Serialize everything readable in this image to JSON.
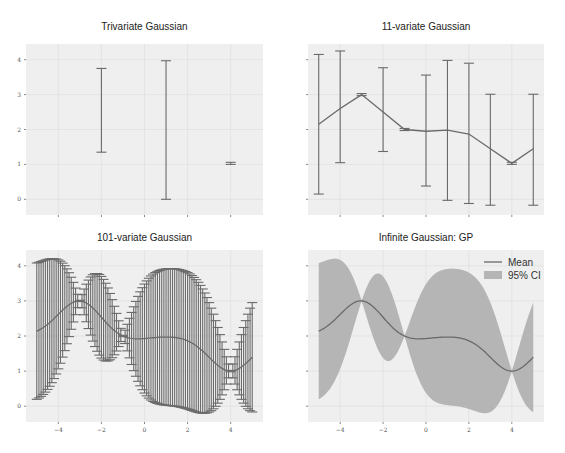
{
  "figure": {
    "width": 565,
    "height": 453,
    "background": "#ffffff"
  },
  "colors": {
    "axes_bg": "#eaeaf2",
    "axes_bg_light": "#efefef",
    "grid": "#dcdcdc",
    "line": "#6a6a6a",
    "fill": "#b5b5b5",
    "text": "#222222"
  },
  "chart_data": [
    {
      "type": "errorbar",
      "title": "Trivariate Gaussian",
      "panel": "top-left",
      "xlim": [
        -5.5,
        5.5
      ],
      "ylim": [
        -0.45,
        4.45
      ],
      "xticks": [
        -4,
        -2,
        0,
        2,
        4
      ],
      "xtick_labels": [
        "",
        "",
        "",
        "",
        ""
      ],
      "yticks": [
        0,
        1,
        2,
        3,
        4
      ],
      "ytick_labels": [
        "0",
        "1",
        "2",
        "3",
        "4"
      ],
      "connect_means": false,
      "points": [
        {
          "x": -2,
          "mean": 2.55,
          "lo": 1.35,
          "hi": 3.75
        },
        {
          "x": 1,
          "mean": 2.0,
          "lo": 0.0,
          "hi": 3.97
        },
        {
          "x": 4,
          "mean": 1.03,
          "lo": 1.0,
          "hi": 1.06
        }
      ]
    },
    {
      "type": "errorbar",
      "title": "11-variate Gaussian",
      "panel": "top-right",
      "xlim": [
        -5.5,
        5.5
      ],
      "ylim": [
        -0.45,
        4.45
      ],
      "xticks": [
        -4,
        -2,
        0,
        2,
        4
      ],
      "xtick_labels": [
        "",
        "",
        "",
        "",
        ""
      ],
      "yticks": [
        0,
        1,
        2,
        3,
        4
      ],
      "ytick_labels": [
        "",
        "",
        "",
        "",
        ""
      ],
      "connect_means": true,
      "points": [
        {
          "x": -5,
          "mean": 2.15,
          "lo": 0.15,
          "hi": 4.15
        },
        {
          "x": -4,
          "mean": 2.6,
          "lo": 1.05,
          "hi": 4.25
        },
        {
          "x": -3,
          "mean": 3.0,
          "lo": 2.97,
          "hi": 3.03
        },
        {
          "x": -2,
          "mean": 2.5,
          "lo": 1.37,
          "hi": 3.77
        },
        {
          "x": -1,
          "mean": 2.0,
          "lo": 1.97,
          "hi": 2.03
        },
        {
          "x": 0,
          "mean": 1.95,
          "lo": 0.38,
          "hi": 3.56
        },
        {
          "x": 1,
          "mean": 1.98,
          "lo": -0.03,
          "hi": 3.98
        },
        {
          "x": 2,
          "mean": 1.87,
          "lo": -0.12,
          "hi": 3.9
        },
        {
          "x": 3,
          "mean": 1.45,
          "lo": -0.17,
          "hi": 3.01
        },
        {
          "x": 4,
          "mean": 1.03,
          "lo": 1.0,
          "hi": 1.06
        },
        {
          "x": 5,
          "mean": 1.45,
          "lo": -0.17,
          "hi": 3.01
        }
      ]
    },
    {
      "type": "errorbar",
      "title": "101-variate Gaussian",
      "panel": "bottom-left",
      "xlim": [
        -5.5,
        5.5
      ],
      "ylim": [
        -0.45,
        4.45
      ],
      "xticks": [
        -4,
        -2,
        0,
        2,
        4
      ],
      "xtick_labels": [
        "−4",
        "−2",
        "0",
        "2",
        "4"
      ],
      "yticks": [
        0,
        1,
        2,
        3,
        4
      ],
      "ytick_labels": [
        "0",
        "1",
        "2",
        "3",
        "4"
      ],
      "connect_means": true,
      "gp_points": {
        "n": 101,
        "x_start": -5,
        "x_end": 5
      }
    },
    {
      "type": "area",
      "title": "Infinite Gaussian: GP",
      "panel": "bottom-right",
      "xlim": [
        -5.5,
        5.5
      ],
      "ylim": [
        -0.45,
        4.45
      ],
      "xticks": [
        -4,
        -2,
        0,
        2,
        4
      ],
      "xtick_labels": [
        "−4",
        "−2",
        "0",
        "2",
        "4"
      ],
      "yticks": [
        0,
        1,
        2,
        3,
        4
      ],
      "ytick_labels": [
        "",
        "",
        "",
        "",
        ""
      ],
      "legend": {
        "position": "upper right",
        "entries": [
          {
            "label": "Mean",
            "kind": "line"
          },
          {
            "label": "95% CI",
            "kind": "patch"
          }
        ]
      },
      "gp_points": {
        "n": 201,
        "x_start": -5,
        "x_end": 5
      }
    }
  ],
  "gp_model": {
    "observations": [
      {
        "x": -3,
        "y": 3.0
      },
      {
        "x": -1,
        "y": 2.0
      },
      {
        "x": 4,
        "y": 1.0
      }
    ],
    "prior_mean": 2.0,
    "signal_variance": 1.0,
    "lengthscale": 1.0,
    "noise": 0.0001,
    "z": 1.96
  },
  "panels_layout": [
    {
      "left": 26,
      "top": 44,
      "width": 237,
      "height": 171,
      "title_y": 30
    },
    {
      "left": 308,
      "top": 44,
      "width": 236,
      "height": 171,
      "title_y": 30
    },
    {
      "left": 26,
      "top": 250,
      "width": 237,
      "height": 172,
      "title_y": 241
    },
    {
      "left": 308,
      "top": 250,
      "width": 236,
      "height": 172,
      "title_y": 241
    }
  ]
}
